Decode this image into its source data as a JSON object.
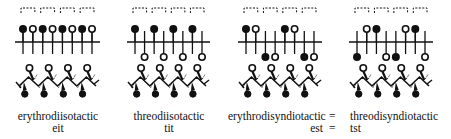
{
  "figure": {
    "panels": [
      {
        "name": "erythrodiisotactic",
        "abbr": "eit",
        "x0": 15,
        "x1": 100,
        "substituents": [
          "up-filled",
          "up-open",
          "up-filled",
          "up-open",
          "up-filled",
          "up-open",
          "up-filled",
          "up-open"
        ]
      },
      {
        "name": "threodiisotactic",
        "abbr": "tit",
        "x0": 127,
        "x1": 210,
        "substituents": [
          "up-filled",
          "down-open",
          "up-filled",
          "down-open",
          "up-filled",
          "down-open",
          "up-filled",
          "down-open"
        ]
      },
      {
        "name": "erythrodisyndiotactic",
        "abbr": "est",
        "x0": 238,
        "x1": 322,
        "substituents": [
          "up-filled",
          "up-open",
          "down-filled",
          "down-open",
          "up-filled",
          "up-open",
          "down-filled",
          "down-open"
        ]
      },
      {
        "name": "threodisyndiotactic",
        "abbr": "tst",
        "x0": 349,
        "x1": 433,
        "substituents": [
          "down-filled",
          "up-open",
          "up-filled",
          "down-open",
          "down-filled",
          "up-open",
          "up-filled",
          "down-open"
        ]
      }
    ],
    "equals_sign": "=",
    "colors": {
      "ink": "#111111",
      "background": "#ffffff"
    }
  }
}
